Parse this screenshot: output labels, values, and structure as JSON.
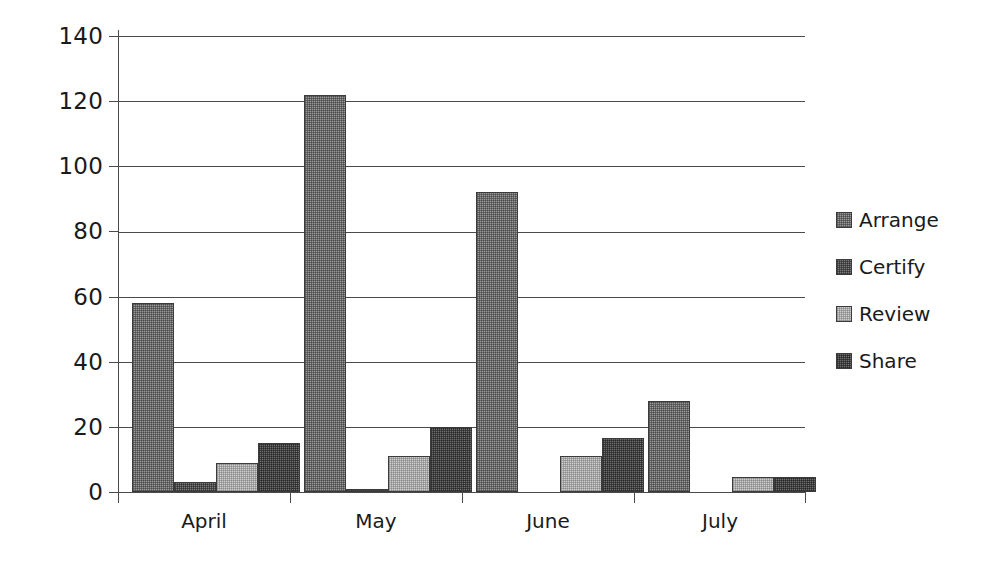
{
  "chart_data": {
    "type": "bar",
    "title": "",
    "subtitle": "",
    "xlabel": "",
    "ylabel": "",
    "categories": [
      "April",
      "May",
      "June",
      "July"
    ],
    "series": [
      {
        "name": "Arrange",
        "values": [
          58,
          122,
          92,
          28
        ],
        "color": "#9a9a9a"
      },
      {
        "name": "Certify",
        "values": [
          3,
          1,
          0,
          0
        ],
        "color": "#7d7d7d"
      },
      {
        "name": "Review",
        "values": [
          9,
          11,
          11,
          4.5
        ],
        "color": "#cfcfcf"
      },
      {
        "name": "Share",
        "values": [
          15,
          20,
          16.5,
          4.5
        ],
        "color": "#6f6f6f"
      }
    ],
    "ylim": [
      0,
      140
    ],
    "yticks": [
      0,
      20,
      40,
      60,
      80,
      100,
      120,
      140
    ],
    "ytick_labels": [
      "0",
      "20",
      "40",
      "60",
      "80",
      "100",
      "120",
      "140"
    ],
    "grid": true,
    "grid_axis": "y",
    "legend": true,
    "legend_position": "right",
    "orientation": "vertical",
    "grouping": "clustered"
  },
  "axis": {
    "y_labels": [
      "140",
      "120",
      "100",
      "80",
      "60",
      "40",
      "20",
      "0"
    ],
    "x_labels": [
      "April",
      "May",
      "June",
      "July"
    ]
  },
  "legend": {
    "items": [
      {
        "label": "Arrange"
      },
      {
        "label": "Certify"
      },
      {
        "label": "Review"
      },
      {
        "label": "Share"
      }
    ]
  },
  "colors": {
    "axis": "#4a4a4a",
    "grid": "#4a4a4a",
    "text": "#1a1a1a",
    "background": "#ffffff",
    "arrange": "#9a9a9a",
    "certify": "#7d7d7d",
    "review": "#cfcfcf",
    "share": "#6f6f6f"
  }
}
